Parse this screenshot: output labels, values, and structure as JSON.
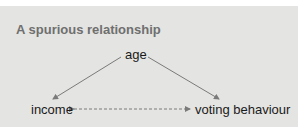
{
  "diagram": {
    "title": "A spurious relationship",
    "nodes": {
      "age": "age",
      "income": "income",
      "voting": "voting behaviour"
    },
    "edges": [
      {
        "from": "age",
        "to": "income",
        "style": "solid",
        "direction": "forward"
      },
      {
        "from": "age",
        "to": "voting behaviour",
        "style": "solid",
        "direction": "forward"
      },
      {
        "from": "income",
        "to": "voting behaviour",
        "style": "dashed",
        "direction": "bidirectional"
      }
    ],
    "colors": {
      "background": "#e4e4e2",
      "title": "#6f6f6f",
      "text": "#1a1a1a",
      "arrow": "#7a7a7a"
    }
  }
}
